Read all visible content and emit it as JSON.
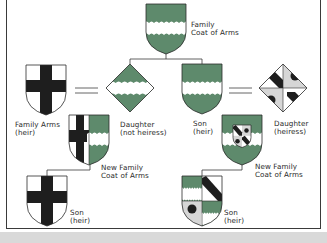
{
  "colors": {
    "field_green": "#5e8a6c",
    "wavy_white": "#ffffff",
    "cross_black": "#1e1e1e",
    "light_gray": "#d6d6d6",
    "outline": "#2b2b2b",
    "line": "#3a3a3a",
    "bottom_strip": "#d9d9d9"
  },
  "nodes": {
    "family_arms": {
      "line1": "Family",
      "line2": "Coat of Arms"
    },
    "family_arms_heir": {
      "line1": "Family Arms",
      "line2": "(heir)"
    },
    "daughter_not_heiress": {
      "line1": "Daughter",
      "line2": "(not heiress)"
    },
    "son_heir": {
      "line1": "Son",
      "line2": "(heir)"
    },
    "daughter_heiress": {
      "line1": "Daughter",
      "line2": "(heiress)"
    },
    "new_arms_left": {
      "line1": "New Family",
      "line2": "Coat of Arms"
    },
    "new_arms_right": {
      "line1": "New Family",
      "line2": "Coat of Arms"
    },
    "son_left": {
      "line1": "Son",
      "line2": "(heir)"
    },
    "son_right": {
      "line1": "Son",
      "line2": "(heir)"
    }
  },
  "relations": [
    {
      "type": "marriage",
      "symbol": "=",
      "between": [
        "family_arms_heir",
        "daughter_not_heiress"
      ]
    },
    {
      "type": "marriage",
      "symbol": "=",
      "between": [
        "son_heir",
        "daughter_heiress"
      ]
    },
    {
      "type": "child",
      "from": "family_arms",
      "to": [
        "daughter_not_heiress",
        "son_heir"
      ]
    },
    {
      "type": "result",
      "from": [
        "family_arms_heir",
        "daughter_not_heiress"
      ],
      "to": "new_arms_left"
    },
    {
      "type": "result",
      "from": [
        "son_heir",
        "daughter_heiress"
      ],
      "to": "new_arms_right"
    },
    {
      "type": "child",
      "from": "new_arms_left",
      "to": [
        "son_left"
      ]
    },
    {
      "type": "child",
      "from": "new_arms_right",
      "to": [
        "son_right"
      ]
    }
  ]
}
